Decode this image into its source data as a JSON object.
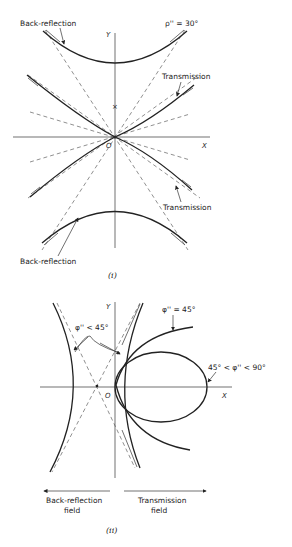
{
  "figure_i": {
    "caption": "(i)",
    "label_back_reflection_top": "Back-reflection",
    "label_back_reflection_bottom": "Back-reflection",
    "label_transmission_top": "Transmission",
    "label_transmission_bottom": "Transmission",
    "label_angle": "ρ'' = 30°",
    "axis_x": "X",
    "axis_y": "Y",
    "origin": "O"
  },
  "figure_ii": {
    "caption": "(ii)",
    "label_phi_less_45": "φ'' < 45°",
    "label_phi_eq_45": "φ'' = 45°",
    "label_phi_range": "45° < φ'' < 90°",
    "axis_x": "X",
    "axis_y": "Y",
    "origin": "O",
    "field_back_reflection_line1": "Back-reflection",
    "field_back_reflection_line2": "field",
    "field_transmission_line1": "Transmission",
    "field_transmission_line2": "field"
  }
}
